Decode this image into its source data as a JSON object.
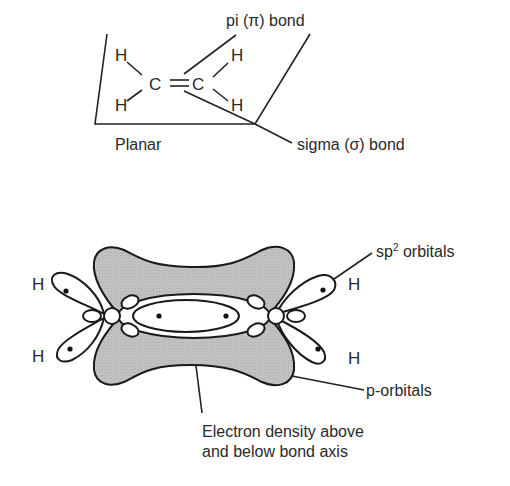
{
  "top_diagram": {
    "plane_label": "Planar",
    "atoms": {
      "h1": "H",
      "h2": "H",
      "h3": "H",
      "h4": "H",
      "c1": "C",
      "c2": "C",
      "double_bond": "="
    },
    "labels": {
      "pi_bond": "pi (π) bond",
      "sigma_bond": "sigma (σ) bond"
    }
  },
  "bottom_diagram": {
    "atoms": {
      "h_left_top": "H",
      "h_left_bottom": "H",
      "h_right_top": "H",
      "h_right_bottom": "H"
    },
    "labels": {
      "sp2_prefix": "sp",
      "sp2_sup": "2",
      "sp2_suffix": " orbitals",
      "p_orbitals": "p-orbitals",
      "electron_density_line1": "Electron density above",
      "electron_density_line2": "and below bond axis"
    }
  },
  "colors": {
    "line": "#222222",
    "text": "#2a2a2a",
    "p_orbital_fill": "#bdbdbd",
    "background": "#ffffff"
  }
}
